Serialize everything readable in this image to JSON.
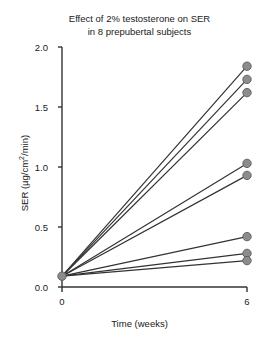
{
  "chart": {
    "title_line1": "Effect of 2% testosterone on SER",
    "title_line2": "in 8 prepubertal subjects",
    "xlabel": "Time (weeks)",
    "ylabel_prefix": "SER (µg/cm",
    "ylabel_exponent": "2",
    "ylabel_suffix": "/min)",
    "yticks": [
      "0.0",
      "0.5",
      "1.0",
      "1.5",
      "2.0"
    ],
    "xticks": [
      "0",
      "6"
    ],
    "line_color": "#333333",
    "marker_fill": "#8c8c8c",
    "marker_edge": "#5a5a5a",
    "axis_color": "#333333",
    "background": "#ffffff"
  },
  "chart_data": {
    "type": "line",
    "title": "Effect of 2% testosterone on SER in 8 prepubertal subjects",
    "xlabel": "Time (weeks)",
    "ylabel": "SER (µg/cm2/min)",
    "x": [
      0,
      6
    ],
    "xlim": [
      0,
      6
    ],
    "ylim": [
      0.0,
      2.0
    ],
    "ytick_values": [
      0.0,
      0.5,
      1.0,
      1.5,
      2.0
    ],
    "xtick_values": [
      0,
      6
    ],
    "grid": false,
    "legend": "none",
    "markers": "filled gray circles at week 6 and a single shared marker at week 0",
    "note": "All 8 subjects share a common starting value at week 0",
    "series": [
      {
        "name": "Subject 1",
        "values": [
          0.09,
          1.84
        ]
      },
      {
        "name": "Subject 2",
        "values": [
          0.09,
          1.73
        ]
      },
      {
        "name": "Subject 3",
        "values": [
          0.09,
          1.62
        ]
      },
      {
        "name": "Subject 4",
        "values": [
          0.09,
          1.03
        ]
      },
      {
        "name": "Subject 5",
        "values": [
          0.09,
          0.93
        ]
      },
      {
        "name": "Subject 6",
        "values": [
          0.09,
          0.42
        ]
      },
      {
        "name": "Subject 7",
        "values": [
          0.09,
          0.28
        ]
      },
      {
        "name": "Subject 8",
        "values": [
          0.09,
          0.22
        ]
      }
    ]
  }
}
